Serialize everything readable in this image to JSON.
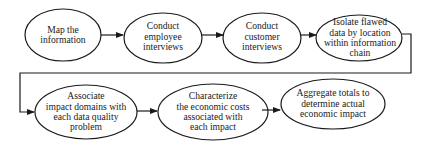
{
  "diagram": {
    "type": "flowchart",
    "nodes": [
      {
        "id": "n1",
        "label": "Map the information",
        "lines": [
          "Map the",
          "information"
        ]
      },
      {
        "id": "n2",
        "label": "Conduct employee interviews",
        "lines": [
          "Conduct",
          "employee",
          "interviews"
        ]
      },
      {
        "id": "n3",
        "label": "Conduct customer interviews",
        "lines": [
          "Conduct",
          "customer",
          "interviews"
        ]
      },
      {
        "id": "n4",
        "label": "Isolate flawed data by location within information chain",
        "lines": [
          "Isolate flawed",
          "data by location",
          "within information",
          "chain"
        ]
      },
      {
        "id": "n5",
        "label": "Associate impact domains with each data quality problem",
        "lines": [
          "Associate",
          "impact domains with",
          "each data quality",
          "problem"
        ]
      },
      {
        "id": "n6",
        "label": "Characterize the economic costs associated with each impact",
        "lines": [
          "Characterize",
          "the economic costs",
          "associated with",
          "each impact"
        ]
      },
      {
        "id": "n7",
        "label": "Aggregate totals to determine actual economic impact",
        "lines": [
          "Aggregate totals to",
          "determine actual",
          "economic impact"
        ]
      }
    ],
    "edges": [
      {
        "from": "n1",
        "to": "n2"
      },
      {
        "from": "n2",
        "to": "n3"
      },
      {
        "from": "n3",
        "to": "n4"
      },
      {
        "from": "n4",
        "to": "n5"
      },
      {
        "from": "n5",
        "to": "n6"
      },
      {
        "from": "n6",
        "to": "n7"
      }
    ],
    "colors": {
      "stroke": "#1a1a1a",
      "background": "#ffffff"
    }
  }
}
